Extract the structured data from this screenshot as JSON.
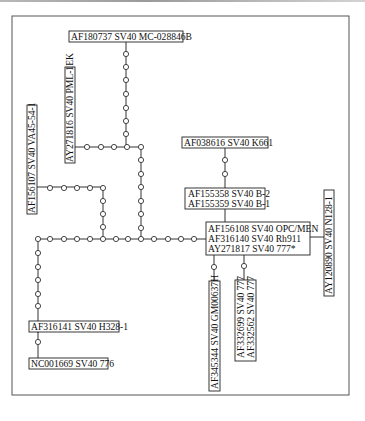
{
  "diagram": {
    "type": "median-joining haplotype network",
    "labels": {
      "af180737": "AF180737 SV40 MC-028846B",
      "ay271816": "AY271816 SV40 PML-1EK",
      "af156107": "AF156107 SV40 VA45-54-1",
      "af038616": "AF038616 SV40 K661",
      "af155358": "AF155358 SV40 B-2",
      "af155359": "AF155359 SV40 B-1",
      "af156108": "AF156108 SV40 OPC/MEN",
      "af316140": "AF316140 SV40 Rh911",
      "ay271817": "AY271817 SV40 777*",
      "ay120890": "AY120890 SV40 N128-1",
      "af316141": "AF316141 SV40 H328-1",
      "nc001669": "NC001669 SV40 776",
      "af345344": "AF345344 SV40 GM00637H",
      "af332699": "AF332699 SV40 777",
      "af332562": "AF332562 SV40 777"
    },
    "edges": [
      {
        "from": "AF180737 SV40 MC-028846B",
        "to": "junction-A",
        "median_vectors": 8
      },
      {
        "from": "AY271816 SV40 PML-1EK",
        "to": "junction-A",
        "median_vectors": 3
      },
      {
        "from": "junction-A",
        "to": "main-chain",
        "median_vectors": 7
      },
      {
        "from": "AF156107 SV40 VA45-54-1",
        "to": "main-chain",
        "median_vectors": 8
      },
      {
        "from": "AF038616 SV40 K661",
        "to": "AF155358/AF155359",
        "median_vectors": 2
      },
      {
        "from": "AF155358/AF155359",
        "to": "AF156108/AF316140/AY271817",
        "median_vectors": 0
      },
      {
        "from": "AF156108/AF316140/AY271817",
        "to": "AY120890 SV40 N128-1",
        "median_vectors": 0
      },
      {
        "from": "AF156108/AF316140/AY271817",
        "to": "AF345344 SV40 GM00637H",
        "median_vectors": 1
      },
      {
        "from": "AF156108/AF316140/AY271817",
        "to": "AF332699/AF332562",
        "median_vectors": 1
      },
      {
        "from": "main-chain",
        "to": "AF156108/AF316140/AY271817",
        "median_vectors": 12
      },
      {
        "from": "main-chain",
        "to": "AF316141 SV40 H328-1",
        "median_vectors": 6
      },
      {
        "from": "AF316141 SV40 H328-1",
        "to": "NC001669 SV40 776",
        "median_vectors": 1
      }
    ]
  }
}
